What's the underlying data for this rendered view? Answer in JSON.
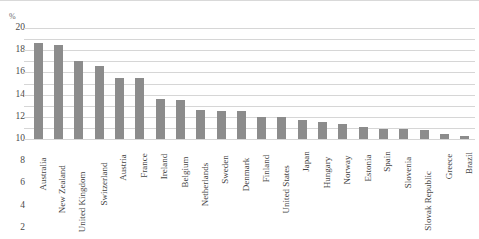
{
  "chart_data": {
    "type": "bar",
    "title": "",
    "subtitle": "",
    "xlabel": "",
    "ylabel": "%",
    "unit_label": "%",
    "ylim": [
      0,
      20
    ],
    "ytick_step": 2,
    "yticks": [
      20,
      18,
      16,
      14,
      12,
      10,
      8,
      6,
      4,
      2,
      0
    ],
    "ytick_labels": [
      "20",
      "18",
      "16",
      "14",
      "12",
      "10",
      "8",
      "6",
      "4",
      "2",
      "0"
    ],
    "grid": true,
    "grid_axis": "y",
    "legend": false,
    "legend_position": "none",
    "orientation": "vertical",
    "sorted": "descending",
    "bar_color": "#8c8c8c",
    "gridline_color": "#d6d6d6",
    "label_rotation": -90,
    "categories": [
      "Australia",
      "New Zealand",
      "United Kingdom",
      "Switzerland",
      "Austria",
      "France",
      "Ireland",
      "Belgium",
      "Netherlands",
      "Sweden",
      "Denmark",
      "Finland",
      "United States",
      "Japan",
      "Hungary",
      "Norway",
      "Estonia",
      "Spain",
      "Slovenia",
      "Slovak Republic",
      "Greece",
      "Brazil"
    ],
    "values": [
      17.3,
      17.0,
      14.0,
      13.2,
      11.0,
      11.0,
      7.2,
      7.0,
      5.2,
      5.0,
      5.0,
      4.0,
      3.9,
      3.4,
      3.0,
      2.7,
      2.2,
      1.8,
      1.8,
      1.7,
      0.9,
      0.5
    ]
  }
}
